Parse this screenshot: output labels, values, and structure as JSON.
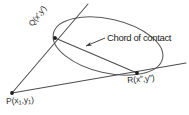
{
  "figure": {
    "kind": "geometry-diagram",
    "background_color": "#ffffff",
    "stroke_color": "#555555",
    "text_color": "#2b2b2b",
    "width": 189,
    "height": 115
  },
  "labels": {
    "chord_of_contact": "Chord of contact",
    "point_q": {
      "full": "Q(x′,y′)",
      "name": "Q",
      "open": "(",
      "x": "x′",
      "comma": ",",
      "y": "y′",
      "close": ")"
    },
    "point_r": {
      "full": "R(x″,y″)",
      "name": "R",
      "open": "(",
      "x": "x″",
      "comma": ",",
      "y": "y″",
      "close": ")"
    },
    "point_p": {
      "full": "P(x₁,y₁)",
      "name": "P",
      "open": "(",
      "x": "x",
      "x_sub": "1",
      "comma": ",",
      "y": "y",
      "y_sub": "1",
      "close": ")"
    }
  },
  "geometry": {
    "points": {
      "P": {
        "x": 12,
        "y": 93,
        "label": "P(x₁,y₁)"
      },
      "Q": {
        "x": 55,
        "y": 38,
        "label": "Q(x′,y′)"
      },
      "R": {
        "x": 137,
        "y": 73,
        "label": "R(x″,y″)"
      }
    },
    "conic": {
      "type": "ellipse",
      "center_x": 108,
      "center_y": 46,
      "radius_x": 56,
      "radius_y": 27,
      "rotation_deg": 13
    },
    "segments": [
      {
        "name": "tangent-PQ",
        "from": "P",
        "to": "Q",
        "extends_beyond": "Q"
      },
      {
        "name": "tangent-PR",
        "from": "P",
        "to": "R",
        "extends_beyond": "R"
      },
      {
        "name": "chord-QR",
        "from": "Q",
        "to": "R"
      }
    ],
    "leader": {
      "name": "chord-leader-arrow",
      "from_x": 104,
      "from_y": 38,
      "to_x": 84,
      "to_y": 47
    }
  }
}
